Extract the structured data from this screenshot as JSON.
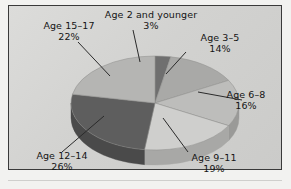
{
  "chart_data": {
    "type": "pie",
    "title": "",
    "subtitle": "",
    "xlabel": "",
    "ylabel": "",
    "legend_position": "none",
    "grid": false,
    "three_d": true,
    "units": "percent",
    "categories": [
      "Age 2 and younger",
      "Age 3-5",
      "Age 6-8",
      "Age 9-11",
      "Age 12-14",
      "Age 15-17"
    ],
    "values": [
      3,
      14,
      16,
      19,
      26,
      22
    ],
    "slices": [
      {
        "label": "Age 2 and younger",
        "value": 3,
        "pct_text": "3%",
        "color": "#6f6f6f",
        "side_color": "#555555"
      },
      {
        "label": "Age 3–5",
        "value": 14,
        "pct_text": "14%",
        "color": "#a9a9a7",
        "side_color": "#8a8a88"
      },
      {
        "label": "Age 6–8",
        "value": 16,
        "pct_text": "16%",
        "color": "#bdbdbb",
        "side_color": "#9a9a98"
      },
      {
        "label": "Age 9–11",
        "value": 19,
        "pct_text": "19%",
        "color": "#cfcfcd",
        "side_color": "#a8a8a6"
      },
      {
        "label": "Age 12–14",
        "value": 26,
        "pct_text": "26%",
        "color": "#5e5e5e",
        "side_color": "#4a4a4a"
      },
      {
        "label": "Age 15–17",
        "value": 22,
        "pct_text": "22%",
        "color": "#b5b5b3",
        "side_color": "#939391"
      }
    ],
    "labels_display": [
      {
        "name": "age-2-and-younger",
        "title": "Age 2 and younger",
        "pct": "3%"
      },
      {
        "name": "age-3-5",
        "title": "Age 3–5",
        "pct": "14%"
      },
      {
        "name": "age-6-8",
        "title": "Age 6–8",
        "pct": "16%"
      },
      {
        "name": "age-9-11",
        "title": "Age 9–11",
        "pct": "19%"
      },
      {
        "name": "age-12-14",
        "title": "Age 12–14",
        "pct": "26%"
      },
      {
        "name": "age-15-17",
        "title": "Age 15–17",
        "pct": "22%"
      }
    ],
    "background_color": "#d5d5d3",
    "border_color": "#3a3a3a",
    "text_color": "#141414",
    "leader_line_color": "#2a2a2a"
  }
}
